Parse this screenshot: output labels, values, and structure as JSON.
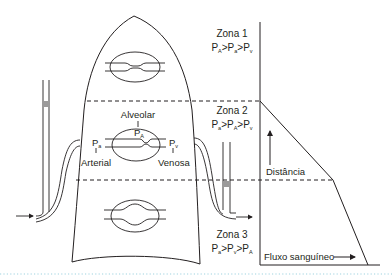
{
  "diagram": {
    "zones": [
      {
        "title": "Zona 1",
        "relation": [
          "P",
          "A",
          ">",
          "P",
          "a",
          ">",
          "P",
          "v"
        ]
      },
      {
        "title": "Zona 2",
        "relation": [
          "P",
          "a",
          ">",
          "P",
          "A",
          ">",
          "P",
          "v"
        ]
      },
      {
        "title": "Zona 3",
        "relation": [
          "P",
          "a",
          ">",
          "P",
          "v",
          ">",
          "P",
          "A"
        ]
      }
    ],
    "labels": {
      "alveolar": "Alveolar",
      "pa_letter": "P",
      "pa_sub": "a",
      "pA_letter": "P",
      "pA_sub": "A",
      "pv_letter": "P",
      "pv_sub": "v",
      "arterial": "Arterial",
      "venosa": "Venosa"
    },
    "graph": {
      "y_axis_label": "Distância",
      "x_axis_label": "Fluxo sanguíneo"
    },
    "colors": {
      "ink": "#231f20",
      "footer_dots": "#9fd3e0"
    }
  }
}
